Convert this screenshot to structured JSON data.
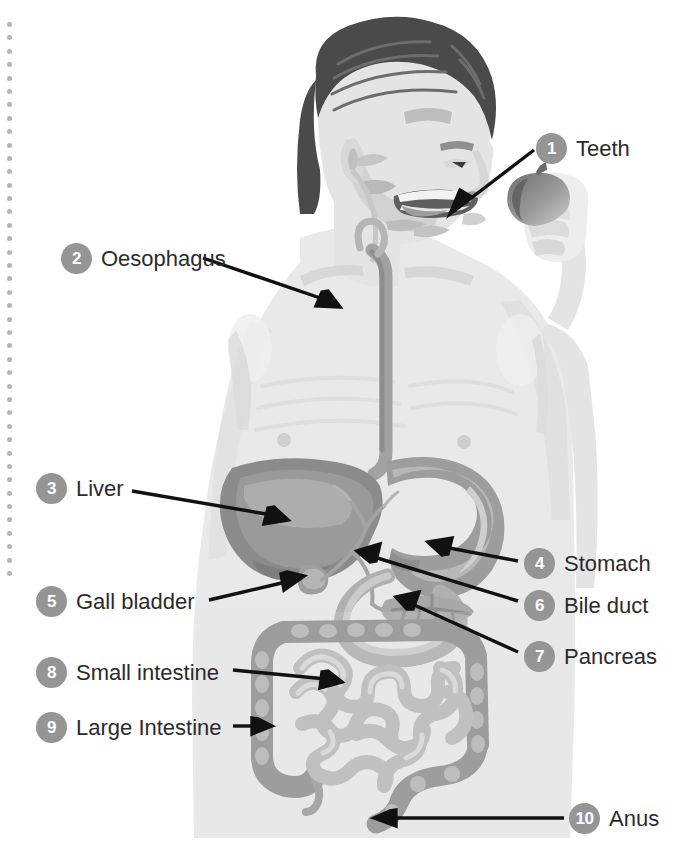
{
  "page": {
    "background_color": "#ffffff",
    "binding_hole_count": 42,
    "binding_hole_color": "#b4b4b4"
  },
  "style": {
    "badge_color": "#959595",
    "badge_text_color": "#ffffff",
    "label_text_color": "#2b2b2b",
    "leader_line_color": "#111111",
    "hair_color": "#4a4a4a",
    "skin_color": "#e9e9e9",
    "organ_dark": "#8d8d8d",
    "organ_mid": "#a9a9a9",
    "organ_light": "#c9c9c9"
  },
  "diagram": {
    "type": "labelled-anatomical-illustration",
    "label_count": 10,
    "labels": [
      {
        "number": "1",
        "text": "Teeth",
        "side": "right",
        "badge_x": 536,
        "badge_y": 133,
        "points_to": "mouth / teeth",
        "arrow_from_x": 536,
        "arrow_from_y": 150,
        "arrow_to_x": 452,
        "arrow_to_y": 214
      },
      {
        "number": "2",
        "text": "Oesophagus",
        "side": "left",
        "badge_x": 61,
        "badge_y": 243,
        "points_to": "oesophagus in the neck",
        "arrow_from_x": 200,
        "arrow_from_y": 258,
        "arrow_to_x": 338,
        "arrow_to_y": 307
      },
      {
        "number": "3",
        "text": "Liver",
        "side": "left",
        "badge_x": 36,
        "badge_y": 473,
        "points_to": "liver",
        "arrow_from_x": 133,
        "arrow_from_y": 492,
        "arrow_to_x": 286,
        "arrow_to_y": 520
      },
      {
        "number": "4",
        "text": "Stomach",
        "side": "right",
        "badge_x": 524,
        "badge_y": 548,
        "points_to": "stomach",
        "arrow_from_x": 521,
        "arrow_from_y": 560,
        "arrow_to_x": 429,
        "arrow_to_y": 542
      },
      {
        "number": "5",
        "text": "Gall bladder",
        "side": "left",
        "badge_x": 36,
        "badge_y": 586,
        "points_to": "gall bladder",
        "arrow_from_x": 208,
        "arrow_from_y": 600,
        "arrow_to_x": 302,
        "arrow_to_y": 576
      },
      {
        "number": "6",
        "text": "Bile duct",
        "side": "right",
        "badge_x": 524,
        "badge_y": 590,
        "points_to": "bile duct",
        "arrow_from_x": 521,
        "arrow_from_y": 600,
        "arrow_to_x": 358,
        "arrow_to_y": 551
      },
      {
        "number": "7",
        "text": "Pancreas",
        "side": "right",
        "badge_x": 524,
        "badge_y": 641,
        "points_to": "pancreas",
        "arrow_from_x": 521,
        "arrow_from_y": 651,
        "arrow_to_x": 397,
        "arrow_to_y": 598
      },
      {
        "number": "8",
        "text": "Small intestine",
        "side": "left",
        "badge_x": 36,
        "badge_y": 657,
        "points_to": "small intestine",
        "arrow_from_x": 233,
        "arrow_from_y": 670,
        "arrow_to_x": 338,
        "arrow_to_y": 682
      },
      {
        "number": "9",
        "text": "Large Intestine",
        "side": "left",
        "badge_x": 36,
        "badge_y": 712,
        "points_to": "large intestine (ascending colon)",
        "arrow_from_x": 233,
        "arrow_from_y": 726,
        "arrow_to_x": 268,
        "arrow_to_y": 726
      },
      {
        "number": "10",
        "text": "Anus",
        "side": "right",
        "badge_x": 569,
        "badge_y": 803,
        "points_to": "anus / rectum",
        "arrow_from_x": 566,
        "arrow_from_y": 818,
        "arrow_to_x": 375,
        "arrow_to_y": 818
      }
    ],
    "organs_depicted": [
      "teeth",
      "tongue",
      "oral cavity",
      "oesophagus",
      "liver",
      "stomach",
      "gall bladder",
      "bile duct",
      "pancreas",
      "duodenum",
      "small intestine",
      "large intestine",
      "rectum",
      "anus",
      "appendix"
    ],
    "held_object": "apple"
  }
}
